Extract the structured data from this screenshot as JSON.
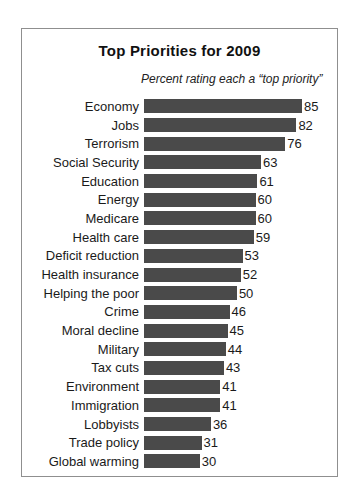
{
  "chart_data": {
    "type": "bar",
    "orientation": "horizontal",
    "title": "Top Priorities for 2009",
    "subtitle": "Percent rating each a “top priority”",
    "categories": [
      "Economy",
      "Jobs",
      "Terrorism",
      "Social Security",
      "Education",
      "Energy",
      "Medicare",
      "Health care",
      "Deficit reduction",
      "Health insurance",
      "Helping the poor",
      "Crime",
      "Moral decline",
      "Military",
      "Tax cuts",
      "Environment",
      "Immigration",
      "Lobbyists",
      "Trade policy",
      "Global warming"
    ],
    "values": [
      85,
      82,
      76,
      63,
      61,
      60,
      60,
      59,
      53,
      52,
      50,
      46,
      45,
      44,
      43,
      41,
      41,
      36,
      31,
      30
    ],
    "xlim": [
      0,
      100
    ],
    "grid": false,
    "legend": "none",
    "data_labels": "end-of-bar",
    "bar_color": "#4a4a4a",
    "max_bar_px": 158,
    "max_value_for_scale": 85
  },
  "colors": {
    "frame_border": "#8f8f8f",
    "background": "#ffffff",
    "text": "#1a1a1a",
    "bar": "#4a4a4a"
  }
}
